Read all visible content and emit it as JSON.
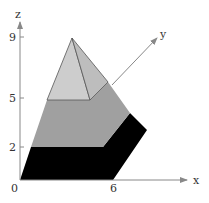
{
  "axes": {
    "z_label": "z",
    "y_label": "y",
    "x_label": "x",
    "origin_label": "0",
    "z_ticks": [
      "9",
      "5",
      "2"
    ],
    "x_ticks": [
      "6"
    ],
    "axis_color": "#888888"
  },
  "layers": [
    {
      "name": "bottom-layer",
      "z_range": [
        0,
        2
      ],
      "color": "#000000"
    },
    {
      "name": "middle-layer",
      "z_range": [
        2,
        5
      ],
      "color": "#a0a0a0"
    },
    {
      "name": "pyramid-top",
      "z_range": [
        5,
        9
      ],
      "color": "#c8c8c8"
    }
  ]
}
